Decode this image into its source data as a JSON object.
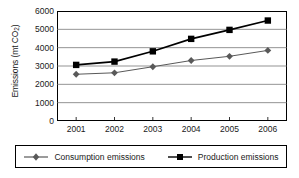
{
  "chart_data": {
    "type": "line",
    "title": "",
    "xlabel": "",
    "ylabel": "Emissions (mt CO2)",
    "ylabel_main": "Emissions (mt CO",
    "ylabel_sub": "2",
    "ylabel_tail": ")",
    "categories": [
      "2001",
      "2002",
      "2003",
      "2004",
      "2005",
      "2006"
    ],
    "ylim": [
      0,
      6000
    ],
    "yticks": [
      6000,
      5000,
      4000,
      3000,
      2000,
      1000,
      0
    ],
    "ytick_labels": [
      "6000",
      "5000",
      "4000",
      "3000",
      "2000",
      "1000",
      "0"
    ],
    "grid": "horizontal",
    "legend_position": "bottom",
    "series": [
      {
        "name": "Consumption emissions",
        "marker": "diamond",
        "color": "#595959",
        "values": [
          2550,
          2630,
          2960,
          3300,
          3530,
          3850
        ]
      },
      {
        "name": "Production emissions",
        "marker": "square",
        "color": "#000000",
        "values": [
          3060,
          3240,
          3800,
          4480,
          4970,
          5480
        ]
      }
    ]
  },
  "legend": {
    "items": [
      {
        "label": "Consumption emissions",
        "marker": "diamond-marker",
        "color": "#595959"
      },
      {
        "label": "Production emissions",
        "marker": "square-marker",
        "color": "#000000"
      }
    ]
  }
}
